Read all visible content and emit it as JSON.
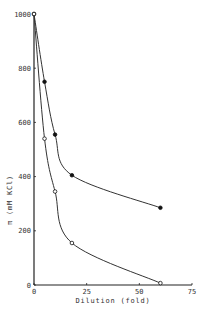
{
  "chart_data": {
    "type": "line",
    "title": "",
    "xlabel": "Dilution  (fold)",
    "ylabel": "π   (mM KCl)",
    "xlim": [
      0,
      75
    ],
    "ylim": [
      0,
      1000
    ],
    "xticks": [
      0,
      25,
      50,
      75
    ],
    "yticks": [
      0,
      200,
      400,
      600,
      800,
      1000
    ],
    "grid": false,
    "legend": null,
    "series": [
      {
        "name": "filled circles",
        "marker": "filled-circle",
        "x": [
          0,
          5,
          10,
          18,
          60
        ],
        "y": [
          1000,
          750,
          555,
          405,
          285
        ]
      },
      {
        "name": "open circles",
        "marker": "open-circle",
        "x": [
          0,
          5,
          10,
          18,
          60
        ],
        "y": [
          1000,
          540,
          345,
          155,
          7
        ]
      }
    ]
  }
}
